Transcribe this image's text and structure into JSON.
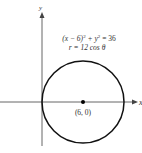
{
  "diagram": {
    "type": "polar-circle-plot",
    "axes": {
      "x_label": "x",
      "y_label": "y"
    },
    "equations": {
      "cartesian": "(x − 6)² + y² = 36",
      "cartesian_parts": {
        "base": "(x − 6)",
        "exp1": "2",
        "mid": " + y",
        "exp2": "2",
        "rhs": " = 36"
      },
      "polar": "r = 12 cos θ"
    },
    "center_point": {
      "label": "(6, 0)",
      "x": 6,
      "y": 0
    },
    "circle": {
      "center": [
        6,
        0
      ],
      "radius": 6
    },
    "colors": {
      "stroke": "#000000",
      "axis": "#555555",
      "text": "#333333"
    }
  }
}
